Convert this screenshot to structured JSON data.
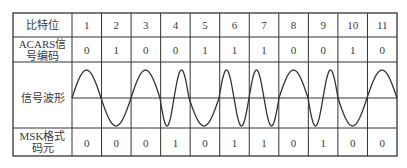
{
  "table": {
    "row_labels": {
      "bit_position": "比特位",
      "acars_line1": "ACARS信",
      "acars_line2": "号编码",
      "waveform": "信号波形",
      "msk_line1": "MSK格式",
      "msk_line2": "码元"
    },
    "bit_positions": [
      "1",
      "2",
      "3",
      "4",
      "5",
      "6",
      "7",
      "8",
      "9",
      "10",
      "11"
    ],
    "acars_code": [
      "0",
      "1",
      "0",
      "0",
      "1",
      "1",
      "1",
      "0",
      "0",
      "1",
      "0"
    ],
    "msk_symbols": [
      "0",
      "0",
      "0",
      "1",
      "0",
      "1",
      "1",
      "0",
      "1",
      "0",
      "0"
    ]
  },
  "waveform": {
    "zero_crossings_x": [
      72,
      101,
      131,
      160,
      174,
      189,
      219,
      234,
      249,
      264,
      279,
      308,
      323,
      338,
      367,
      397
    ],
    "initial_polarity": "up",
    "midline_y": 98,
    "amplitude_px": 28
  },
  "colors": {
    "line": "#333333",
    "text": "#3a3a3a",
    "background": "#ffffff"
  }
}
